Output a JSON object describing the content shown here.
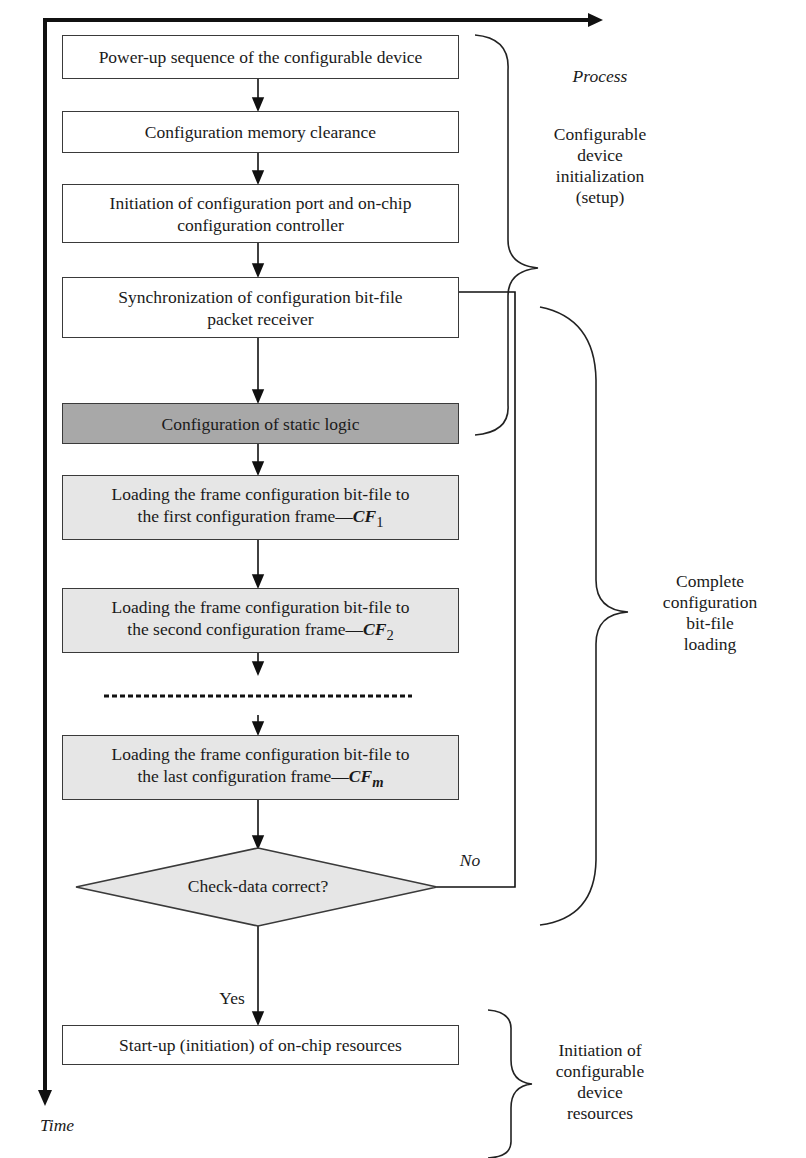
{
  "axes": {
    "time_label": "Time"
  },
  "steps": [
    {
      "id": "power_up",
      "text": "Power-up sequence of the configurable device",
      "shade": "white"
    },
    {
      "id": "mem_clear",
      "text": "Configuration memory clearance",
      "shade": "white"
    },
    {
      "id": "init_port",
      "line1": "Initiation of configuration port and on-chip",
      "line2": "configuration controller",
      "shade": "white"
    },
    {
      "id": "sync",
      "line1": "Synchronization of configuration bit-file",
      "line2": "packet receiver",
      "shade": "white"
    },
    {
      "id": "static",
      "text": "Configuration of static logic",
      "shade": "dark"
    },
    {
      "id": "cf1",
      "line1": "Loading the frame configuration bit-file to",
      "line2": "the first configuration frame—",
      "cf": "CF",
      "sub": "1",
      "shade": "light"
    },
    {
      "id": "cf2",
      "line1": "Loading the frame configuration bit-file to",
      "line2": "the second configuration frame—",
      "cf": "CF",
      "sub": "2",
      "shade": "light"
    },
    {
      "id": "cfm",
      "line1": "Loading the frame configuration bit-file to",
      "line2": "the last configuration frame—",
      "cf": "CF",
      "sub": "m",
      "shade": "light"
    },
    {
      "id": "startup",
      "text": "Start-up (initiation) of on-chip resources",
      "shade": "white"
    }
  ],
  "decision": {
    "text": "Check-data correct?",
    "yes_label": "Yes",
    "no_label": "No"
  },
  "phases": {
    "header": "Process",
    "setup": [
      "Configurable",
      "device",
      "initialization",
      "(setup)"
    ],
    "loading": [
      "Complete",
      "configuration",
      "bit-file",
      "loading"
    ],
    "resources": [
      "Initiation of",
      "configurable",
      "device",
      "resources"
    ]
  },
  "colors": {
    "light_fill": "#e6e6e6",
    "dark_fill": "#a8a8a8",
    "stroke": "#1a1a1a"
  }
}
